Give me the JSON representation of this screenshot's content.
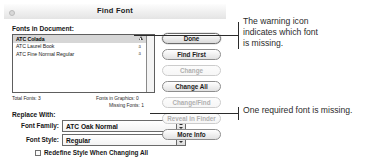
{
  "window": {
    "title": "Find Font",
    "close_button": "close"
  },
  "fonts_section": {
    "label": "Fonts in Document:",
    "rows": [
      {
        "name": "ATC Colada",
        "icon": "warning-triangle-icon",
        "selected": true
      },
      {
        "name": "ATC Laurel Book",
        "icon": "font-glyph-icon",
        "selected": false
      },
      {
        "name": "ATC Fine Normal Regular",
        "icon": "font-glyph-icon",
        "selected": false
      }
    ]
  },
  "status": {
    "total_fonts": "Total Fonts: 3",
    "fonts_in_graphics": "Fonts in Graphics: 0",
    "missing_fonts": "Missing Fonts: 1"
  },
  "replace": {
    "label": "Replace With:",
    "font_family_label": "Font Family:",
    "font_family_value": "ATC Oak Normal",
    "font_style_label": "Font Style:",
    "font_style_value": "Regular",
    "redefine_label": "Redefine Style When Changing All",
    "redefine_checked": false
  },
  "buttons": [
    {
      "label": "Done",
      "state": "default"
    },
    {
      "label": "Find First",
      "state": "enabled"
    },
    {
      "label": "Change",
      "state": "disabled"
    },
    {
      "label": "Change All",
      "state": "enabled"
    },
    {
      "label": "Change/Find",
      "state": "disabled"
    },
    {
      "label": "Reveal in Finder",
      "state": "disabled"
    },
    {
      "label": "More Info",
      "state": "enabled"
    }
  ],
  "annotations": {
    "first": "The warning icon\nindicates which font\nis missing.",
    "second": "One required font is missing."
  },
  "colors": {
    "selection": "#d6d6d6",
    "border": "#5e5e5e",
    "disabled_text": "#b0b0b0",
    "annotation_text": "#2b2b2b"
  }
}
